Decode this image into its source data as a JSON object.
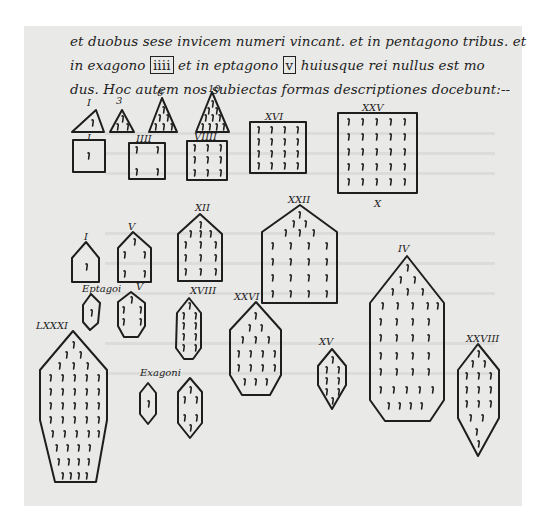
{
  "document": {
    "type": "manuscript-page",
    "page_color": "#e9e9e7",
    "ink_color": "#1e1e1e",
    "text_lines": [
      {
        "pre": "et duobus sese invicem numeri vincant. et in pentagono tribus. et",
        "box": "",
        "post": ""
      },
      {
        "pre": "in exagono",
        "box": "iiii",
        "mid": "et in eptagono",
        "box2": "v",
        "post": "huiusque rei nullus est mo"
      },
      {
        "pre": "dus. Hoc autem nos subiectas formas descriptiones docebunt:--",
        "box": "",
        "post": ""
      }
    ],
    "figures": {
      "triangles": {
        "labels": [
          "I",
          "3",
          "6",
          "10"
        ]
      },
      "squares": {
        "labels": [
          "I",
          "IIII",
          "VIIII",
          "XVI",
          "XXV"
        ],
        "footer": "X"
      },
      "pentagons": {
        "labels": [
          "I",
          "V",
          "XII",
          "XXII"
        ]
      },
      "hexagons": {
        "heading": "Exagoni",
        "labels": [
          "XVII",
          "XXVI",
          "XV",
          "IV"
        ]
      },
      "heptagons": {
        "heading": "Eptagoi",
        "labels": [
          "V",
          "XVIII",
          "XXVIII",
          "LXXXI"
        ]
      }
    }
  }
}
